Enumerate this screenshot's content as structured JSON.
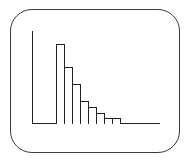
{
  "chart_data": {
    "type": "bar",
    "title": "",
    "xlabel": "",
    "ylabel": "",
    "categories": [
      "1",
      "2",
      "3",
      "4",
      "5",
      "6",
      "7",
      "8"
    ],
    "values": [
      80,
      57,
      40,
      23,
      17,
      11,
      6,
      6
    ],
    "ylim": [
      0,
      92
    ],
    "grid": false,
    "legend": null,
    "style": {
      "bar_fill": "#ffffff",
      "bar_edge": "#222222"
    }
  },
  "layout": {
    "origin_x": 32,
    "baseline_y": 124,
    "first_bar_x": 56,
    "bar_width": 8,
    "px_per_unit": 1.0
  }
}
